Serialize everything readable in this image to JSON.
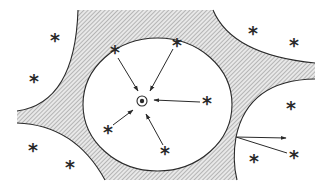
{
  "diagram": {
    "colors": {
      "stroke": "#2a2a2a",
      "hatch": "#9a9a9a",
      "background": "#ffffff"
    },
    "center_site": {
      "x": 142,
      "y": 101,
      "symbol": "⊙"
    },
    "pore_circle": {
      "cx": 157.5,
      "cy": 104.5,
      "rx": 74.5,
      "ry": 66.5
    },
    "molecule_symbol": "*",
    "inner_molecules": [
      {
        "id": "in1",
        "x": 115,
        "y": 50
      },
      {
        "id": "in2",
        "x": 177,
        "y": 43
      },
      {
        "id": "in3",
        "x": 207,
        "y": 101
      },
      {
        "id": "in4",
        "x": 108,
        "y": 130
      },
      {
        "id": "in5",
        "x": 165,
        "y": 151
      }
    ],
    "outer_molecules": [
      {
        "id": "out1",
        "x": 55,
        "y": 38
      },
      {
        "id": "out2",
        "x": 34,
        "y": 79
      },
      {
        "id": "out3",
        "x": 33,
        "y": 148
      },
      {
        "id": "out4",
        "x": 70,
        "y": 165
      },
      {
        "id": "out5",
        "x": 253,
        "y": 31
      },
      {
        "id": "out6",
        "x": 294,
        "y": 43
      },
      {
        "id": "out7",
        "x": 291,
        "y": 106
      },
      {
        "id": "out8",
        "x": 254,
        "y": 159
      },
      {
        "id": "out9",
        "x": 294,
        "y": 155
      }
    ],
    "inward_arrows": [
      {
        "from": [
          118,
          58
        ],
        "to": [
          138,
          91
        ]
      },
      {
        "from": [
          173,
          49
        ],
        "to": [
          150,
          91
        ]
      },
      {
        "from": [
          200,
          102
        ],
        "to": [
          154,
          100
        ]
      },
      {
        "from": [
          113,
          125
        ],
        "to": [
          133,
          110
        ]
      },
      {
        "from": [
          163,
          145
        ],
        "to": [
          146,
          114
        ]
      }
    ],
    "outward_arrows": [
      {
        "from": [
          236,
          137
        ],
        "to": [
          286,
          138
        ]
      },
      {
        "from": [
          236,
          137
        ],
        "to": [
          287,
          153
        ]
      }
    ]
  }
}
